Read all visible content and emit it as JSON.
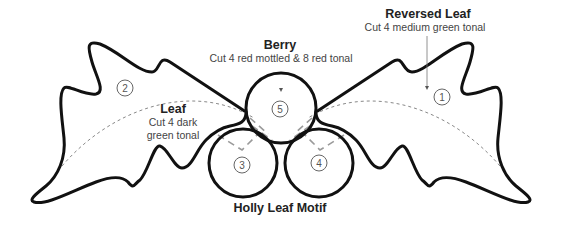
{
  "diagram": {
    "title": "Holly Leaf Motif",
    "pieces": [
      {
        "number": "1",
        "name": "Reversed Leaf",
        "instruction": "Cut 4 medium green tonal"
      },
      {
        "number": "2",
        "name": "Leaf",
        "instruction_line1": "Cut 4 dark",
        "instruction_line2": "green tonal"
      },
      {
        "number": "3",
        "name": "Berry"
      },
      {
        "number": "4",
        "name": "Berry"
      },
      {
        "number": "5",
        "name": "Berry",
        "instruction": "Cut 4 red mottled & 8 red tonal"
      }
    ],
    "labels": {
      "reversed_leaf_title": "Reversed Leaf",
      "reversed_leaf_sub": "Cut 4 medium green tonal",
      "berry_title": "Berry",
      "berry_sub": "Cut 4 red mottled & 8 red tonal",
      "leaf_title": "Leaf",
      "leaf_sub_1": "Cut 4 dark",
      "leaf_sub_2": "green tonal"
    },
    "numbers": {
      "n1": "1",
      "n2": "2",
      "n3": "3",
      "n4": "4",
      "n5": "5"
    },
    "colors": {
      "outline": "#111111",
      "dashed": "#888888",
      "text": "#222222"
    }
  }
}
